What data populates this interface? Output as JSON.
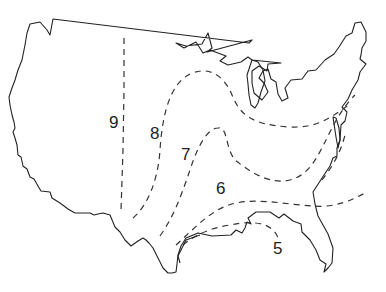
{
  "map": {
    "title": "",
    "region": "Contiguous United States",
    "outline_color": "#222222",
    "zone_line_color": "#333333",
    "zones": [
      {
        "label": "9",
        "x": 109,
        "y": 114
      },
      {
        "label": "8",
        "x": 150,
        "y": 125
      },
      {
        "label": "7",
        "x": 181,
        "y": 146
      },
      {
        "label": "6",
        "x": 216,
        "y": 180
      },
      {
        "label": "5",
        "x": 273,
        "y": 240
      }
    ]
  }
}
